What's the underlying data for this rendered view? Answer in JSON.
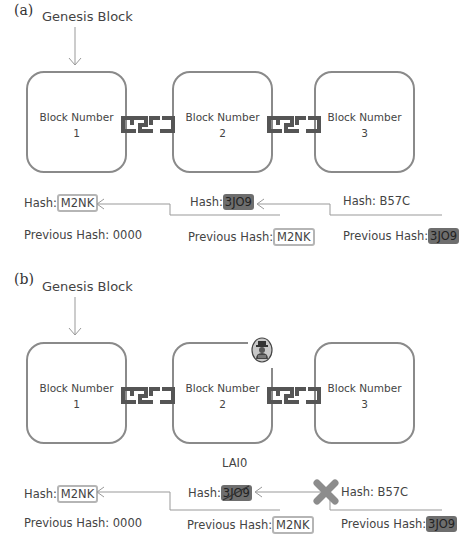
{
  "panels": [
    {
      "label": "(a)",
      "genesis_label": "Genesis Block",
      "blocks": [
        {
          "title": "Block Number",
          "number": "1"
        },
        {
          "title": "Block Number",
          "number": "2"
        },
        {
          "title": "Block Number",
          "number": "3"
        }
      ],
      "hashes": [
        {
          "hash_label": "Hash:",
          "hash": "M2NK",
          "prev_label": "Previous Hash:",
          "prev": "0000"
        },
        {
          "hash_label": "Hash:",
          "hash": "3JO9",
          "prev_label": "Previous Hash:",
          "prev": "M2NK"
        },
        {
          "hash_label": "Hash:",
          "hash": "B57C",
          "prev_label": "Previous Hash:",
          "prev": "3JO9"
        }
      ]
    },
    {
      "label": "(b)",
      "genesis_label": "Genesis Block",
      "blocks": [
        {
          "title": "Block Number",
          "number": "1"
        },
        {
          "title": "Block Number",
          "number": "2"
        },
        {
          "title": "Block Number",
          "number": "3"
        }
      ],
      "tampered_hash": "LAI0",
      "hashes": [
        {
          "hash_label": "Hash:",
          "hash": "M2NK",
          "prev_label": "Previous Hash:",
          "prev": "0000"
        },
        {
          "hash_label": "Hash:",
          "hash": "3JO9",
          "prev_label": "Previous Hash:",
          "prev": "M2NK"
        },
        {
          "hash_label": "Hash:",
          "hash": "B57C",
          "prev_label": "Previous Hash:",
          "prev": "3JO9"
        }
      ]
    }
  ],
  "icons": {
    "chain_link": "chain-link-icon",
    "hacker": "hacker-icon",
    "broken_link": "red-x-icon"
  },
  "colors": {
    "box_border": "#8a8a8a",
    "dark_hash": "#6e6e6e",
    "light_hash_border": "#b5b5b5",
    "x_mark": "#8c8c8c"
  }
}
